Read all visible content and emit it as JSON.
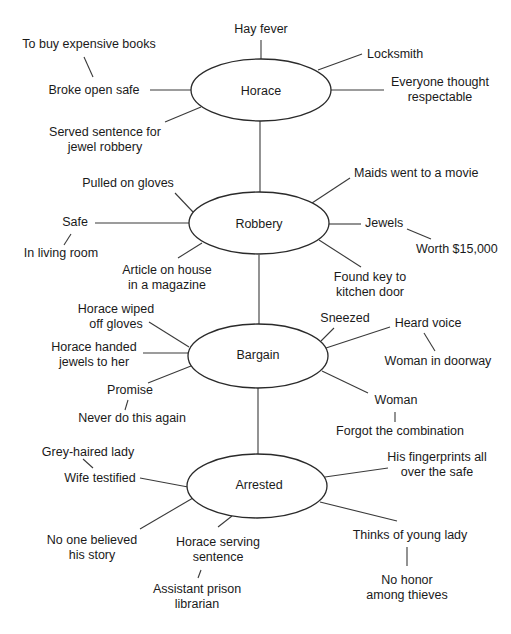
{
  "diagram": {
    "type": "story-map",
    "nodes": [
      {
        "id": "horace",
        "label": "Horace"
      },
      {
        "id": "robbery",
        "label": "Robbery"
      },
      {
        "id": "bargain",
        "label": "Bargain"
      },
      {
        "id": "arrested",
        "label": "Arrested"
      }
    ],
    "horace": {
      "hay_fever": "Hay fever",
      "locksmith": "Locksmith",
      "everyone_thought_1": "Everyone thought",
      "everyone_thought_2": "respectable",
      "broke_open_safe": "Broke open safe",
      "to_buy_books": "To buy expensive books",
      "served_sentence_1": "Served sentence for",
      "served_sentence_2": "jewel robbery"
    },
    "robbery": {
      "pulled_on_gloves": "Pulled on gloves",
      "safe": "Safe",
      "in_living_room": "In living room",
      "article_1": "Article on house",
      "article_2": "in a magazine",
      "maids": "Maids went to a movie",
      "jewels": "Jewels",
      "worth": "Worth $15,000",
      "found_key_1": "Found key to",
      "found_key_2": "kitchen door"
    },
    "bargain": {
      "wiped_1": "Horace wiped",
      "wiped_2": "off gloves",
      "handed_1": "Horace handed",
      "handed_2": "jewels to her",
      "promise": "Promise",
      "never_again": "Never do this again",
      "sneezed": "Sneezed",
      "heard_voice": "Heard voice",
      "woman_doorway": "Woman in doorway",
      "woman": "Woman",
      "forgot_combination": "Forgot the combination"
    },
    "arrested": {
      "grey_haired_lady": "Grey-haired lady",
      "wife_testified": "Wife testified",
      "no_one_believed_1": "No one believed",
      "no_one_believed_2": "his story",
      "serving_1": "Horace serving",
      "serving_2": "sentence",
      "assistant_1": "Assistant prison",
      "assistant_2": "librarian",
      "fingerprints_1": "His fingerprints all",
      "fingerprints_2": "over the safe",
      "thinks_young_lady": "Thinks of young lady",
      "no_honor_1": "No honor",
      "no_honor_2": "among thieves"
    }
  }
}
